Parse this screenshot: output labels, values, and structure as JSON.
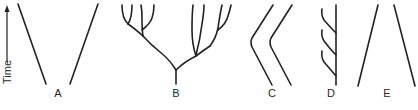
{
  "axis": {
    "label": "Time",
    "direction": "up"
  },
  "panels": [
    {
      "id": "A",
      "label": "A",
      "description": "two lineages diverging from a common point"
    },
    {
      "id": "B",
      "label": "B",
      "description": "adaptive radiation / branching tree"
    },
    {
      "id": "C",
      "label": "C",
      "description": "parallel evolution"
    },
    {
      "id": "D",
      "label": "D",
      "description": "single main lineage with repeated side branches"
    },
    {
      "id": "E",
      "label": "E",
      "description": "two lineages converging"
    }
  ],
  "colors": {
    "line": "#222222",
    "text": "#2a2a2a",
    "background": "#ffffff"
  }
}
